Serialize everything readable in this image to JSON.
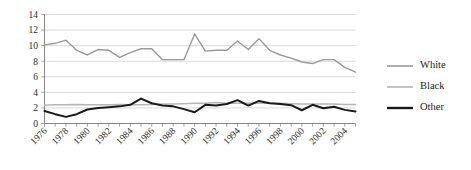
{
  "chart_data": {
    "type": "line",
    "title": "",
    "subtitle": "",
    "xlabel": "",
    "ylabel": "",
    "ylim": [
      0,
      14
    ],
    "ytick_values": [
      0,
      2,
      4,
      6,
      8,
      10,
      12,
      14
    ],
    "ytick_labels": [
      "0",
      "2",
      "4",
      "6",
      "8",
      "10",
      "12",
      "14"
    ],
    "grid": true,
    "grid_axis": "y",
    "legend_position": "right",
    "x": [
      1976,
      1977,
      1978,
      1979,
      1980,
      1981,
      1982,
      1983,
      1984,
      1985,
      1986,
      1987,
      1988,
      1989,
      1990,
      1991,
      1992,
      1993,
      1994,
      1995,
      1996,
      1997,
      1998,
      1999,
      2000,
      2001,
      2002,
      2003,
      2004,
      2005
    ],
    "xtick_labels": [
      "1976",
      "1978",
      "1980",
      "1982",
      "1984",
      "1986",
      "1988",
      "1990",
      "1992",
      "1994",
      "1996",
      "1998",
      "2000",
      "2002",
      "2004"
    ],
    "xtick_values": [
      1976,
      1978,
      1980,
      1982,
      1984,
      1986,
      1988,
      1990,
      1992,
      1994,
      1996,
      1998,
      2000,
      2002,
      2004
    ],
    "xlim": [
      1976,
      2005
    ],
    "series": [
      {
        "name": "White",
        "color": "#9a9a9a",
        "width": 1.4,
        "values": [
          10.1,
          10.3,
          10.7,
          9.4,
          8.8,
          9.5,
          9.4,
          8.5,
          9.1,
          9.6,
          9.6,
          8.2,
          8.2,
          8.2,
          11.5,
          9.3,
          9.4,
          9.4,
          10.6,
          9.5,
          10.9,
          9.4,
          8.8,
          8.4,
          7.9,
          7.7,
          8.2,
          8.2,
          7.2,
          6.6
        ]
      },
      {
        "name": "Black",
        "color": "#b5b5b5",
        "width": 1.5,
        "values": [
          2.35,
          2.4,
          2.4,
          2.45,
          2.4,
          2.4,
          2.4,
          2.45,
          2.4,
          2.4,
          2.45,
          2.5,
          2.5,
          2.55,
          2.6,
          2.6,
          2.7,
          2.6,
          2.6,
          2.6,
          2.6,
          2.6,
          2.6,
          2.55,
          2.5,
          2.5,
          2.5,
          2.5,
          2.45,
          2.45
        ]
      },
      {
        "name": "Other",
        "color": "#1a1a1a",
        "width": 2.0,
        "values": [
          1.6,
          1.2,
          0.85,
          1.2,
          1.8,
          2.0,
          2.1,
          2.2,
          2.4,
          3.2,
          2.6,
          2.3,
          2.2,
          1.85,
          1.45,
          2.4,
          2.3,
          2.5,
          3.0,
          2.3,
          2.9,
          2.6,
          2.5,
          2.35,
          1.7,
          2.4,
          1.95,
          2.15,
          1.75,
          1.55
        ]
      }
    ],
    "legend": [
      {
        "label": "White",
        "color": "#9a9a9a",
        "width": 1.6
      },
      {
        "label": "Black",
        "color": "#b5b5b5",
        "width": 1.6
      },
      {
        "label": "Other",
        "color": "#1a1a1a",
        "width": 2.4
      }
    ]
  }
}
